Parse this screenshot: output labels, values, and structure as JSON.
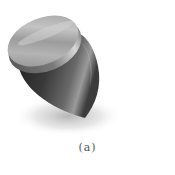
{
  "figure": {
    "caption": "(a)",
    "colors": {
      "background": "#ffffff",
      "cap_light": "#c8c8c8",
      "cap_mid": "#9a9a9a",
      "cap_dark": "#6e6e6e",
      "body_light": "#8a8a8a",
      "body_dark": "#2a2a2a",
      "shadow": "#bdbdbd",
      "caption": "#555555"
    }
  }
}
